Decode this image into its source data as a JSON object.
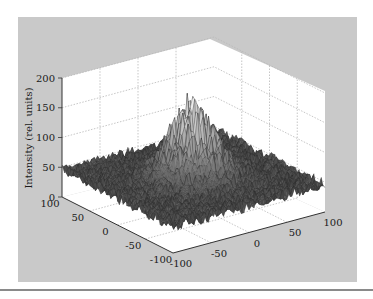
{
  "chart_data": {
    "type": "surface3d",
    "title": "",
    "zlabel": "Intensity (rel. units)",
    "xlabel": "",
    "ylabel": "",
    "z_ticks": [
      "0",
      "50",
      "100",
      "150",
      "200"
    ],
    "zlim": [
      0,
      200
    ],
    "x_ticks": [
      "-100",
      "-50",
      "0",
      "50",
      "100"
    ],
    "xlim": [
      -100,
      100
    ],
    "y_ticks": [
      "100",
      "50",
      "0",
      "-50",
      "-100"
    ],
    "ylim": [
      -100,
      100
    ],
    "grid": true,
    "background_level": 45,
    "background_noise": 10,
    "peak_max": 170,
    "peak_center": [
      0,
      0
    ],
    "peak_width": 25,
    "colormap": "grayscale (dark low, light high)"
  },
  "colors": {
    "panel": "#c9c9c9",
    "wall": "#ffffff",
    "grid": "#b8b8b8",
    "surface_low": "#3a3a3a",
    "surface_high": "#e0e0e0"
  }
}
